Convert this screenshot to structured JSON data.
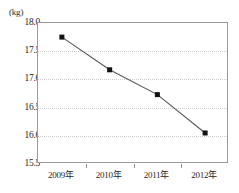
{
  "chart_data": {
    "type": "line",
    "title": "",
    "xlabel": "",
    "ylabel": "(kg)",
    "unit_label": "(kg)",
    "categories": [
      "2009年",
      "2010年",
      "2011年",
      "2012年"
    ],
    "values": [
      17.75,
      17.17,
      16.73,
      16.05
    ],
    "series": [
      {
        "name": "",
        "values": [
          17.75,
          17.17,
          16.73,
          16.05
        ]
      }
    ],
    "ylim": [
      15.5,
      18.0
    ],
    "ytick_labels": [
      "18.0",
      "17.5",
      "17.0",
      "16.5",
      "16.0",
      "15.5"
    ],
    "ytick_values": [
      18.0,
      17.5,
      17.0,
      16.5,
      16.0,
      15.5
    ],
    "grid": true,
    "grid_style": "dotted-horizontal",
    "legend": "none",
    "marker": "filled-square",
    "line_color": "#555555",
    "marker_color": "#111111",
    "grid_color": "#cfcfcf",
    "axis_color": "#9a9a9a"
  }
}
